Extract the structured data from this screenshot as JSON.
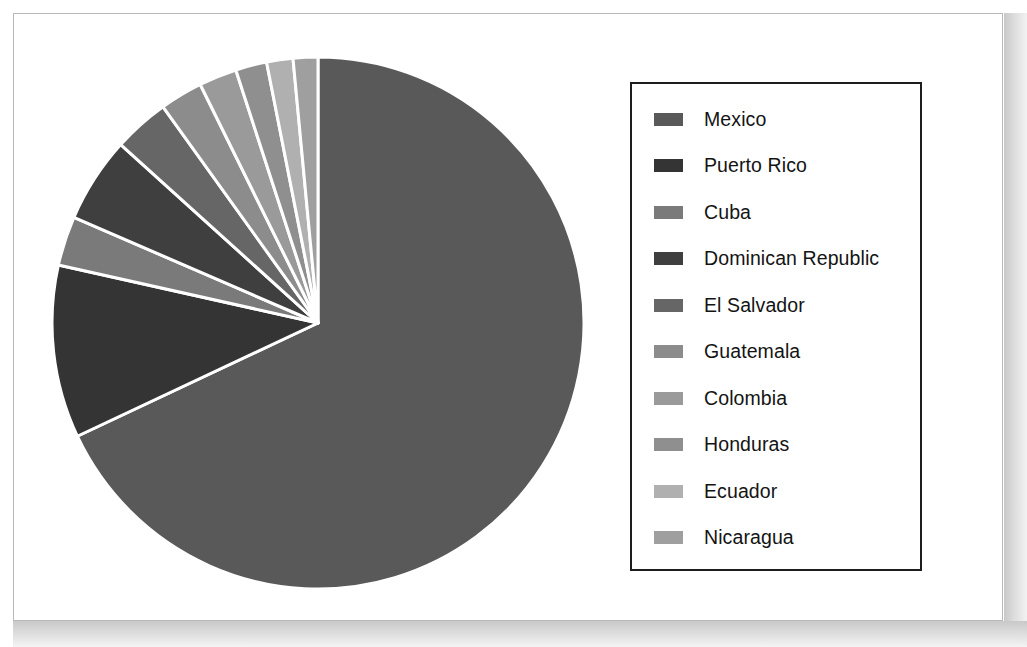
{
  "figure": {
    "background_color": "#ffffff",
    "frame_color": "#b9b9b9",
    "separator_color": "#ffffff"
  },
  "legend": {
    "border_color": "#1d1d1d",
    "background_color": "#ffffff",
    "position": "right"
  },
  "chart_data": {
    "type": "pie",
    "title": "",
    "subtitle": "",
    "xlabel": "",
    "ylabel": "",
    "grid": false,
    "legend_position": "right",
    "start_angle_deg": 0,
    "direction": "clockwise",
    "units": "percent",
    "categories": [
      "Mexico",
      "Puerto Rico",
      "Cuba",
      "Dominican Republic",
      "El Salvador",
      "Guatemala",
      "Colombia",
      "Honduras",
      "Ecuador",
      "Nicaragua"
    ],
    "values": [
      68.0,
      10.5,
      3.0,
      5.2,
      3.4,
      2.6,
      2.3,
      1.9,
      1.6,
      1.5
    ],
    "colors": [
      "#595959",
      "#343434",
      "#7a7a7a",
      "#3f3f3f",
      "#666666",
      "#8c8c8c",
      "#9a9a9a",
      "#8f8f8f",
      "#b0b0b0",
      "#9f9f9f"
    ],
    "slices": [
      {
        "label": "Mexico",
        "value": 68.0,
        "color": "#595959"
      },
      {
        "label": "Puerto Rico",
        "value": 10.5,
        "color": "#343434"
      },
      {
        "label": "Cuba",
        "value": 3.0,
        "color": "#7a7a7a"
      },
      {
        "label": "Dominican Republic",
        "value": 5.2,
        "color": "#3f3f3f"
      },
      {
        "label": "El Salvador",
        "value": 3.4,
        "color": "#666666"
      },
      {
        "label": "Guatemala",
        "value": 2.6,
        "color": "#8c8c8c"
      },
      {
        "label": "Colombia",
        "value": 2.3,
        "color": "#9a9a9a"
      },
      {
        "label": "Honduras",
        "value": 1.9,
        "color": "#8f8f8f"
      },
      {
        "label": "Ecuador",
        "value": 1.6,
        "color": "#b0b0b0"
      },
      {
        "label": "Nicaragua",
        "value": 1.5,
        "color": "#9f9f9f"
      }
    ]
  }
}
